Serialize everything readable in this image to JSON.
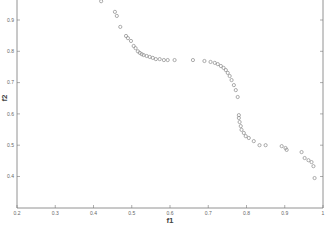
{
  "chart_data": {
    "type": "scatter",
    "title": "",
    "xlabel": "f1",
    "ylabel": "f2",
    "xlim": [
      0.2,
      1.0
    ],
    "ylim": [
      0.3,
      0.966
    ],
    "grid": false,
    "legend": null,
    "x_ticks": [
      "0.2",
      "0.3",
      "0.4",
      "0.5",
      "0.6",
      "0.7",
      "0.8",
      "0.9",
      "1"
    ],
    "y_ticks": [
      "0.4",
      "0.5",
      "0.6",
      "0.7",
      "0.8",
      "0.9"
    ],
    "marker": "open-circle",
    "marker_color": "#8a8a8a",
    "series": [
      {
        "name": "pareto-front",
        "points": [
          [
            0.42,
            0.96
          ],
          [
            0.456,
            0.926
          ],
          [
            0.461,
            0.913
          ],
          [
            0.47,
            0.878
          ],
          [
            0.485,
            0.849
          ],
          [
            0.49,
            0.842
          ],
          [
            0.498,
            0.833
          ],
          [
            0.505,
            0.817
          ],
          [
            0.51,
            0.81
          ],
          [
            0.516,
            0.8
          ],
          [
            0.521,
            0.795
          ],
          [
            0.526,
            0.791
          ],
          [
            0.531,
            0.788
          ],
          [
            0.539,
            0.785
          ],
          [
            0.547,
            0.782
          ],
          [
            0.555,
            0.779
          ],
          [
            0.563,
            0.775
          ],
          [
            0.573,
            0.775
          ],
          [
            0.584,
            0.772
          ],
          [
            0.594,
            0.772
          ],
          [
            0.612,
            0.772
          ],
          [
            0.66,
            0.772
          ],
          [
            0.69,
            0.769
          ],
          [
            0.706,
            0.766
          ],
          [
            0.717,
            0.763
          ],
          [
            0.725,
            0.759
          ],
          [
            0.733,
            0.753
          ],
          [
            0.74,
            0.747
          ],
          [
            0.746,
            0.74
          ],
          [
            0.751,
            0.731
          ],
          [
            0.756,
            0.721
          ],
          [
            0.761,
            0.708
          ],
          [
            0.767,
            0.692
          ],
          [
            0.772,
            0.676
          ],
          [
            0.777,
            0.654
          ],
          [
            0.78,
            0.596
          ],
          [
            0.78,
            0.587
          ],
          [
            0.782,
            0.574
          ],
          [
            0.785,
            0.561
          ],
          [
            0.787,
            0.549
          ],
          [
            0.793,
            0.539
          ],
          [
            0.798,
            0.529
          ],
          [
            0.806,
            0.523
          ],
          [
            0.819,
            0.513
          ],
          [
            0.834,
            0.5
          ],
          [
            0.85,
            0.5
          ],
          [
            0.892,
            0.497
          ],
          [
            0.902,
            0.491
          ],
          [
            0.905,
            0.485
          ],
          [
            0.944,
            0.478
          ],
          [
            0.952,
            0.459
          ],
          [
            0.962,
            0.452
          ],
          [
            0.97,
            0.446
          ],
          [
            0.975,
            0.433
          ],
          [
            0.978,
            0.395
          ]
        ]
      }
    ]
  },
  "layout": {
    "plot_left": 17,
    "plot_right": 323,
    "plot_top": 0,
    "plot_bottom": 208
  }
}
